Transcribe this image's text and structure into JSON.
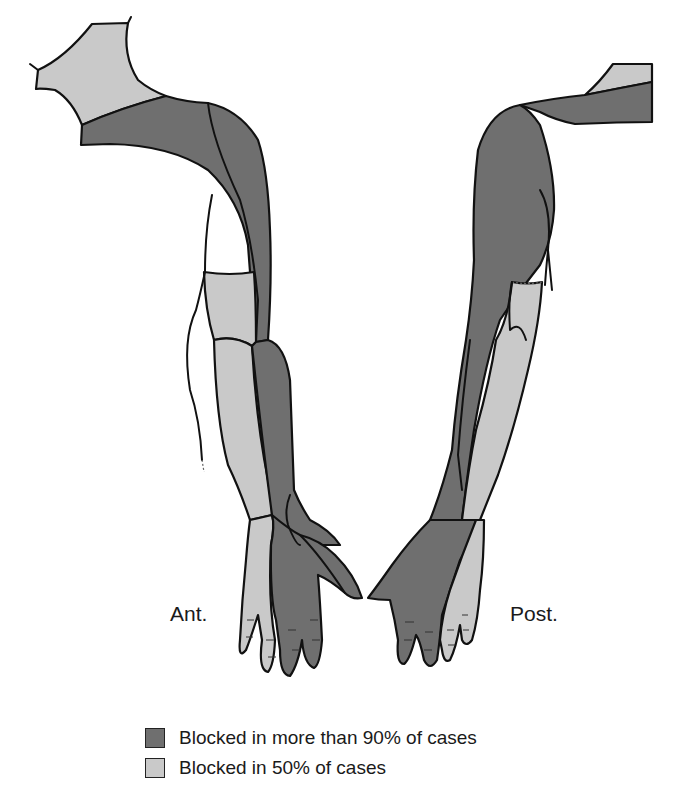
{
  "figure": {
    "views": [
      {
        "id": "anterior",
        "label": "Ant."
      },
      {
        "id": "posterior",
        "label": "Post."
      }
    ],
    "colors": {
      "dark_fill": "#6f6f6f",
      "light_fill": "#c9c9c9",
      "outline": "#111111",
      "background": "#ffffff"
    }
  },
  "legend": {
    "items": [
      {
        "label": "Blocked in more than 90% of cases",
        "swatch_color": "#6f6f6f",
        "icon": "dark-gray-swatch"
      },
      {
        "label": "Blocked in 50% of cases",
        "swatch_color": "#c9c9c9",
        "icon": "light-gray-swatch"
      }
    ]
  }
}
